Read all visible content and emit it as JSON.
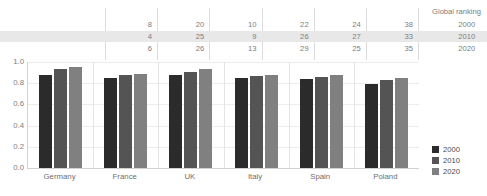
{
  "chart_data": {
    "type": "bar",
    "title": "",
    "xlabel": "",
    "ylabel": "",
    "ylim": [
      0.0,
      1.0
    ],
    "grid": true,
    "legend_position": "right-bottom",
    "categories": [
      "Germany",
      "France",
      "UK",
      "Italy",
      "Spain",
      "Poland"
    ],
    "ytick_labels": [
      "1.0",
      "0.8",
      "0.6",
      "0.4",
      "0.2",
      "0.0"
    ],
    "ytick_values": [
      1.0,
      0.8,
      0.6,
      0.4,
      0.2,
      0.0
    ],
    "series": [
      {
        "name": "2000",
        "color": "#2b2b2b",
        "values": [
          0.88,
          0.85,
          0.88,
          0.85,
          0.84,
          0.79
        ]
      },
      {
        "name": "2010",
        "color": "#545454",
        "values": [
          0.93,
          0.88,
          0.91,
          0.87,
          0.86,
          0.83
        ]
      },
      {
        "name": "2020",
        "color": "#808080",
        "values": [
          0.95,
          0.89,
          0.93,
          0.88,
          0.88,
          0.85
        ]
      }
    ],
    "annotation_table": {
      "title": "Global ranking",
      "row_years": [
        "2000",
        "2010",
        "2020"
      ],
      "highlighted_row": "2010",
      "columns": [
        "Germany",
        "France",
        "UK",
        "Italy",
        "Spain",
        "Poland"
      ],
      "rows": [
        {
          "year": "2000",
          "values": [
            "8",
            "20",
            "10",
            "22",
            "24",
            "38"
          ]
        },
        {
          "year": "2010",
          "values": [
            "4",
            "25",
            "9",
            "26",
            "27",
            "33"
          ]
        },
        {
          "year": "2020",
          "values": [
            "6",
            "26",
            "13",
            "29",
            "25",
            "35"
          ]
        }
      ]
    }
  }
}
